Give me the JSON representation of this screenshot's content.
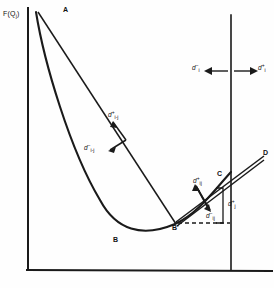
{
  "figure": {
    "kind": "line-diagram",
    "background": "#fefefe",
    "ink": "#1a1a1a",
    "axes": {
      "y_axis_label": "F(Q",
      "y_axis_label_sub": "j",
      "y_axis_label_end": ")",
      "frame": "rectangle with open top, baseline extends past right edge"
    },
    "points": [
      {
        "id": "A",
        "label": "A",
        "x": 66,
        "y": 12
      },
      {
        "id": "B",
        "label": "B",
        "x": 115,
        "y": 240
      },
      {
        "id": "Bp",
        "label": "B'",
        "x": 175,
        "y": 224
      },
      {
        "id": "C",
        "label": "C",
        "x": 219,
        "y": 175
      },
      {
        "id": "D",
        "label": "D",
        "x": 265,
        "y": 154
      }
    ],
    "vectors": [
      {
        "id": "d_plus_i_minus_j",
        "base": "d",
        "sup": "+",
        "sub": "i-j",
        "x": 107,
        "y": 112
      },
      {
        "id": "d_minus_i_minus_j",
        "base": "d",
        "sup": "−",
        "sub": "i-j",
        "x": 100,
        "y": 144
      },
      {
        "id": "d_minus_i",
        "base": "d",
        "sup": "−",
        "sub": "i",
        "x": 194,
        "y": 66
      },
      {
        "id": "d_plus_i",
        "base": "d",
        "sup": "+",
        "sub": "i",
        "x": 246,
        "y": 66
      },
      {
        "id": "d_plus_ij",
        "base": "d",
        "sup": "+",
        "sub": "ij",
        "x": 196,
        "y": 178
      },
      {
        "id": "d_minus_ij",
        "base": "d",
        "sup": "−",
        "sub": "ij",
        "x": 210,
        "y": 212
      },
      {
        "id": "d_bracket",
        "base": "d",
        "sup": "+",
        "sub": "j",
        "x": 238,
        "y": 199
      }
    ],
    "annotations": {
      "double_arrow": "horizontal double-headed arrow straddling the vertical constraint line",
      "bracket": "vertical brace at right of B'-C segment",
      "dashed": "horizontal dashed segment from B' to the bracket"
    }
  }
}
